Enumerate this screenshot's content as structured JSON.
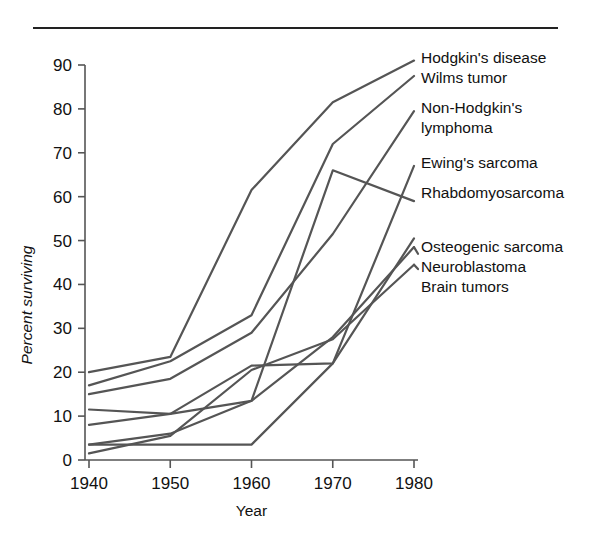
{
  "figure": {
    "top_rule": true
  },
  "chart_data": {
    "type": "line",
    "title": "",
    "xlabel": "Year",
    "ylabel": "Percent surviving",
    "x": [
      1940,
      1950,
      1960,
      1970,
      1980
    ],
    "xlim": [
      1940,
      1980
    ],
    "ylim": [
      0,
      90
    ],
    "xticks": [
      "1940",
      "1950",
      "1960",
      "1970",
      "1980"
    ],
    "yticks": [
      "0",
      "10",
      "20",
      "30",
      "40",
      "50",
      "60",
      "70",
      "80",
      "90"
    ],
    "grid": false,
    "legend_position": "right-inline-labels",
    "series": [
      {
        "name": "Hodgkin's disease",
        "values": [
          20.0,
          23.5,
          61.5,
          81.5,
          91.0
        ],
        "label_x": 1980,
        "label_y": 91.0
      },
      {
        "name": "Wilms tumor",
        "values": [
          17.0,
          22.5,
          33.0,
          72.0,
          87.5
        ],
        "label_x": 1980,
        "label_y": 87.5
      },
      {
        "name": "Non-Hodgkin's lymphoma",
        "values": [
          15.0,
          18.5,
          29.0,
          51.5,
          79.5
        ],
        "label_x": 1980,
        "label_y": 79.5
      },
      {
        "name": "Ewing's sarcoma",
        "values": [
          3.5,
          3.5,
          3.5,
          22.0,
          67.0
        ],
        "label_x": 1980,
        "label_y": 67.0
      },
      {
        "name": "Rhabdomyosarcoma",
        "values": [
          11.5,
          10.5,
          13.5,
          66.0,
          59.0
        ],
        "label_x": 1980,
        "label_y": 59.0
      },
      {
        "name": "Osteogenic sarcoma",
        "values": [
          8.0,
          10.5,
          21.5,
          22.0,
          50.5
        ],
        "label_x": 1980,
        "label_y": 50.5
      },
      {
        "name": "Neuroblastoma",
        "values": [
          3.5,
          6.0,
          13.5,
          28.0,
          48.5
        ],
        "label_x": 1980,
        "label_y": 47.0
      },
      {
        "name": "Brain tumors",
        "values": [
          1.5,
          5.5,
          20.5,
          27.5,
          44.5
        ],
        "label_x": 1980,
        "label_y": 43.5
      }
    ],
    "series_label_lines": [
      {
        "text": "Hodgkin's disease",
        "x": 421,
        "y": 63
      },
      {
        "text": "Wilms tumor",
        "x": 421,
        "y": 83
      },
      {
        "text": "Non-Hodgkin's",
        "x": 421,
        "y": 113
      },
      {
        "text": "lymphoma",
        "x": 421,
        "y": 133
      },
      {
        "text": "Ewing's sarcoma",
        "x": 421,
        "y": 168
      },
      {
        "text": "Rhabdomyosarcoma",
        "x": 421,
        "y": 198
      },
      {
        "text": "Osteogenic sarcoma",
        "x": 421,
        "y": 252
      },
      {
        "text": "Neuroblastoma",
        "x": 421,
        "y": 272
      },
      {
        "text": "Brain tumors",
        "x": 421,
        "y": 292
      }
    ],
    "colors": {
      "line": "#555555",
      "axis": "#555555",
      "text": "#111111",
      "background": "#ffffff"
    }
  }
}
